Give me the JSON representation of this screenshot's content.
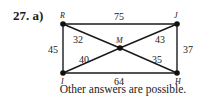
{
  "problem": {
    "label": "27. a)"
  },
  "graph": {
    "vertices": [
      {
        "id": "R",
        "label": "R",
        "x": 63,
        "y": 24
      },
      {
        "id": "J",
        "label": "J",
        "x": 177,
        "y": 24
      },
      {
        "id": "I",
        "label": "I",
        "x": 63,
        "y": 73
      },
      {
        "id": "H",
        "label": "H",
        "x": 177,
        "y": 73
      },
      {
        "id": "M",
        "label": "M",
        "x": 120,
        "y": 48
      }
    ],
    "edges": [
      {
        "from": "R",
        "to": "J",
        "weight": "75"
      },
      {
        "from": "R",
        "to": "I",
        "weight": "45"
      },
      {
        "from": "J",
        "to": "H",
        "weight": "37"
      },
      {
        "from": "I",
        "to": "H",
        "weight": "64"
      },
      {
        "from": "R",
        "to": "M",
        "weight": "32"
      },
      {
        "from": "M",
        "to": "J",
        "weight": "43"
      },
      {
        "from": "I",
        "to": "M",
        "weight": "40"
      },
      {
        "from": "M",
        "to": "H",
        "weight": "35"
      }
    ]
  },
  "footnote": "Other answers are possible."
}
